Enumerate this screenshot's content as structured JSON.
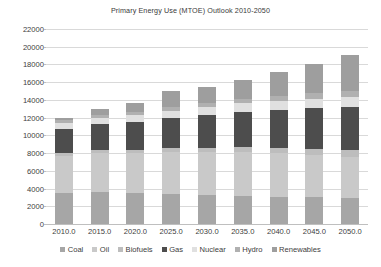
{
  "chart_data": {
    "type": "bar",
    "subtype": "stacked-column",
    "title": "Primary Energy Use (MTOE) Outlook 2010-2050",
    "xlabel": "",
    "ylabel": "",
    "ylim": [
      0,
      22000
    ],
    "ytick_step": 2000,
    "yticks": [
      0,
      2000,
      4000,
      6000,
      8000,
      10000,
      12000,
      14000,
      16000,
      18000,
      20000,
      22000
    ],
    "ytick_labels": [
      "0",
      "2000",
      "4000",
      "6000",
      "8000",
      "10000",
      "12000",
      "14000",
      "16000",
      "18000",
      "20000",
      "22000"
    ],
    "grid": true,
    "grid_axis": "y",
    "legend_position": "bottom",
    "categories": [
      "2010.0",
      "2015.0",
      "2020.0",
      "2025.0",
      "2030.0",
      "2035.0",
      "2040.0",
      "2045.0",
      "2050.0"
    ],
    "x": [
      2010,
      2015,
      2020,
      2025,
      2030,
      2035,
      2040,
      2045,
      2050
    ],
    "series": [
      {
        "name": "Coal",
        "color": "#a6a6a6",
        "values": [
          3500,
          3600,
          3500,
          3400,
          3300,
          3200,
          3100,
          3000,
          2900
        ]
      },
      {
        "name": "Oil",
        "color": "#c9c9c9",
        "values": [
          4200,
          4400,
          4500,
          4700,
          4800,
          4900,
          4900,
          4800,
          4700
        ]
      },
      {
        "name": "Biofuels",
        "color": "#bdbdbd",
        "values": [
          300,
          350,
          400,
          450,
          500,
          550,
          600,
          650,
          700
        ]
      },
      {
        "name": "Gas",
        "color": "#4d4d4d",
        "values": [
          2700,
          2900,
          3100,
          3400,
          3700,
          4000,
          4300,
          4600,
          4900
        ]
      },
      {
        "name": "Nuclear",
        "color": "#e0e0e0",
        "values": [
          700,
          750,
          800,
          850,
          900,
          950,
          1000,
          1050,
          1100
        ]
      },
      {
        "name": "Hydro",
        "color": "#b0b0b0",
        "values": [
          300,
          350,
          400,
          450,
          500,
          550,
          600,
          650,
          700
        ]
      },
      {
        "name": "Renewables",
        "color": "#9e9e9e",
        "values": [
          300,
          650,
          1000,
          1750,
          1800,
          2050,
          2700,
          3350,
          4100
        ]
      }
    ],
    "totals": [
      12000,
      13000,
      13700,
      15000,
      15500,
      16200,
      17200,
      18100,
      19100
    ]
  },
  "legend": {
    "items": [
      "Coal",
      "Oil",
      "Biofuels",
      "Gas",
      "Nuclear",
      "Hydro",
      "Renewables"
    ]
  }
}
